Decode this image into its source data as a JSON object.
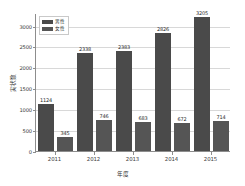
{
  "chart_data": {
    "type": "bar",
    "title": "",
    "xlabel": "年度",
    "ylabel": "実状数",
    "categories": [
      "2011",
      "2012",
      "2013",
      "2014",
      "2015"
    ],
    "series": [
      {
        "name": "男性",
        "values": [
          1124,
          2338,
          2383,
          2826,
          3205
        ],
        "color": "#4a4a4a"
      },
      {
        "name": "女性",
        "values": [
          345,
          746,
          683,
          672,
          714
        ],
        "color": "#555555"
      }
    ],
    "ylim": [
      0,
      3300
    ],
    "yticks": [
      0,
      500,
      1000,
      1500,
      2000,
      2500,
      3000
    ],
    "ytick_labels": [
      "0",
      "500",
      "1000",
      "1500",
      "2000",
      "2500",
      "3000"
    ],
    "grid": true,
    "legend_position": "upper-left",
    "show_value_labels": true
  }
}
